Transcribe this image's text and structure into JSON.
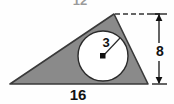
{
  "figure": {
    "kind": "geometry-diagram",
    "background_color": "#fefefe",
    "shape_fill_color": "#8a8a8a",
    "shape_stroke_color": "#3a3a3a",
    "circle_fill_color": "#ffffff",
    "dimension_color": "#111111"
  },
  "triangle": {
    "name": "shaded-triangle",
    "vertices": [
      {
        "x": 10,
        "y": 84
      },
      {
        "x": 148,
        "y": 84
      },
      {
        "x": 114,
        "y": 14
      }
    ],
    "base_length_label": "16",
    "height_label": "8",
    "top_label": "12"
  },
  "circle": {
    "name": "inscribed-circle",
    "center": {
      "x": 103,
      "y": 56
    },
    "radius_px": 25,
    "radius_label": "3"
  },
  "dimensions": {
    "base": {
      "label": "16",
      "position": "bottom",
      "x": 78,
      "y": 99
    },
    "height": {
      "label": "8",
      "position": "right",
      "x": 160,
      "y": 55,
      "arrow_top_y": 14,
      "arrow_bottom_y": 84,
      "line_x": 159
    },
    "radius": {
      "label": "3",
      "x": 106,
      "y": 46
    },
    "top_edge": {
      "label": "12",
      "x": 80,
      "y": 5,
      "clipped": true
    }
  },
  "dashed_line": {
    "name": "apex-extension-dashed-line",
    "from": {
      "x": 114,
      "y": 14
    },
    "to": {
      "x": 162,
      "y": 14
    },
    "style": "dashed"
  }
}
